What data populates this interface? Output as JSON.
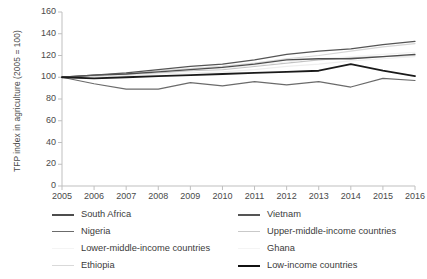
{
  "chart_data": {
    "type": "line",
    "title": "",
    "xlabel": "",
    "ylabel": "TFP index in agriculture (2005 = 100)",
    "x": [
      2005,
      2006,
      2007,
      2008,
      2009,
      2010,
      2011,
      2012,
      2013,
      2014,
      2015,
      2016
    ],
    "xtick_labels": [
      "2005",
      "2006",
      "2007",
      "2008",
      "2009",
      "2010",
      "2011",
      "2012",
      "2013",
      "2014",
      "2015",
      "2016"
    ],
    "ylim": [
      0,
      160
    ],
    "ytick_labels": [
      "0",
      "20",
      "40",
      "60",
      "80",
      "100",
      "120",
      "140",
      "160"
    ],
    "ytick_values": [
      0,
      20,
      40,
      60,
      80,
      100,
      120,
      140,
      160
    ],
    "grid": false,
    "legend_position": "bottom",
    "series": [
      {
        "name": "South Africa",
        "color": "#4d4d4d",
        "width": 1.3,
        "values": [
          100,
          102,
          103,
          105,
          107,
          109,
          112,
          116,
          117,
          117,
          119,
          121
        ]
      },
      {
        "name": "Vietnam",
        "color": "#555555",
        "width": 1.3,
        "values": [
          100,
          102,
          104,
          107,
          110,
          112,
          116,
          121,
          124,
          126,
          130,
          133
        ]
      },
      {
        "name": "Nigeria",
        "color": "#6b6b6b",
        "width": 1.2,
        "values": [
          100,
          94,
          89,
          89,
          95,
          92,
          96,
          93,
          96,
          91,
          99,
          97
        ]
      },
      {
        "name": "Upper-middle-income countries",
        "color": "#c4c4c4",
        "width": 1.2,
        "values": [
          100,
          101,
          102,
          104,
          106,
          107,
          110,
          113,
          116,
          118,
          119,
          120
        ]
      },
      {
        "name": "Lower-middle-income countries",
        "color": "#efefef",
        "width": 1.2,
        "values": [
          100,
          101,
          102,
          103,
          104,
          105,
          107,
          110,
          112,
          115,
          117,
          119
        ]
      },
      {
        "name": "Ghana",
        "color": "#f2f2f2",
        "width": 1.2,
        "values": [
          100,
          101,
          103,
          105,
          107,
          108,
          111,
          114,
          117,
          119,
          121,
          123
        ]
      },
      {
        "name": "Ethiopia",
        "color": "#d6d6d6",
        "width": 1.2,
        "values": [
          100,
          101,
          103,
          106,
          108,
          110,
          113,
          117,
          120,
          124,
          128,
          131
        ]
      },
      {
        "name": "Low-income countries",
        "color": "#1a1a1a",
        "width": 1.8,
        "values": [
          100,
          99,
          100,
          101,
          102,
          103,
          104,
          105,
          106,
          112,
          106,
          101
        ]
      }
    ]
  },
  "legend": {
    "entries": [
      {
        "label": "South Africa",
        "color": "#4d4d4d",
        "width": 2.0
      },
      {
        "label": "Vietnam",
        "color": "#555555",
        "width": 2.0
      },
      {
        "label": "Nigeria",
        "color": "#6b6b6b",
        "width": 1.8
      },
      {
        "label": "Upper-middle-income countries",
        "color": "#c9c9c9",
        "width": 1.4
      },
      {
        "label": "Lower-middle-income countries",
        "color": "#f4f4f4",
        "width": 1.2
      },
      {
        "label": "Ghana",
        "color": "#f4f4f4",
        "width": 1.2
      },
      {
        "label": "Ethiopia",
        "color": "#d9d9d9",
        "width": 1.4
      },
      {
        "label": "Low-income countries",
        "color": "#111111",
        "width": 2.6
      }
    ]
  },
  "axis": {
    "line_color": "#bfbfbf",
    "tick_color": "#bfbfbf"
  }
}
